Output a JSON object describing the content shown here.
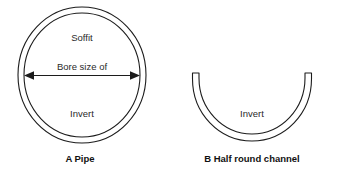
{
  "figure": {
    "background_color": "#ffffff",
    "line_color": "#1c1c1c",
    "text_color": "#2a2a2a",
    "width": 340,
    "height": 180
  },
  "panel_a": {
    "caption_letter": "A",
    "caption_label": "Pipe",
    "caption_full": "A   Pipe",
    "shape": "double-circle-annulus",
    "labels": {
      "top": "Soffit",
      "bottom": "Invert",
      "dimension": "Bore size of"
    },
    "dimension_arrow": {
      "style": "double-headed",
      "orientation": "horizontal",
      "label": "Bore size of"
    }
  },
  "panel_b": {
    "caption_letter": "B",
    "caption_label": "Half round channel",
    "caption_full": "B   Half round channel",
    "shape": "half-round-open-channel",
    "labels": {
      "bottom": "Invert"
    }
  }
}
